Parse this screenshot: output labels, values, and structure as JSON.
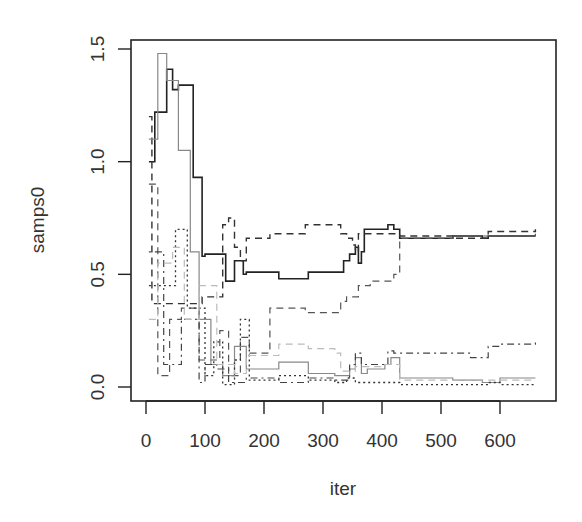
{
  "chart_data": {
    "type": "line",
    "subtype": "step",
    "title": "",
    "xlabel": "iter",
    "ylabel": "samps0",
    "xlim": [
      -25,
      700
    ],
    "ylim": [
      -0.06,
      1.55
    ],
    "x_ticks": [
      0,
      100,
      200,
      300,
      400,
      500,
      600
    ],
    "x_tick_labels": [
      "0",
      "100",
      "200",
      "300",
      "400",
      "500",
      "600"
    ],
    "y_ticks": [
      0.0,
      0.5,
      1.0,
      1.5
    ],
    "y_tick_labels": [
      "0.0",
      "0.5",
      "1.0",
      "1.5"
    ],
    "grid": false,
    "legend": null,
    "series": [
      {
        "name": "chain 1",
        "style": "solid",
        "color": "#222222",
        "width": 1.6,
        "x": [
          5,
          15,
          35,
          45,
          55,
          80,
          95,
          100,
          135,
          150,
          165,
          170,
          225,
          275,
          335,
          345,
          355,
          360,
          365,
          370,
          400,
          410,
          420,
          430,
          520,
          570,
          580,
          620,
          660
        ],
        "y": [
          1.0,
          1.22,
          1.41,
          1.32,
          1.34,
          0.93,
          0.58,
          0.59,
          0.47,
          0.56,
          0.5,
          0.51,
          0.48,
          0.51,
          0.56,
          0.59,
          0.62,
          0.55,
          0.6,
          0.7,
          0.7,
          0.72,
          0.7,
          0.66,
          0.67,
          0.66,
          0.67,
          0.67,
          0.67
        ]
      },
      {
        "name": "chain 2",
        "style": "dashed",
        "color": "#333333",
        "width": 1.4,
        "x": [
          5,
          10,
          95,
          130,
          140,
          150,
          160,
          170,
          210,
          270,
          330,
          340,
          350,
          355,
          360,
          430,
          520,
          580,
          660
        ],
        "y": [
          1.2,
          0.37,
          0.4,
          0.72,
          0.75,
          0.62,
          0.56,
          0.66,
          0.68,
          0.72,
          0.68,
          0.66,
          0.63,
          0.6,
          0.68,
          0.67,
          0.66,
          0.69,
          0.7
        ]
      },
      {
        "name": "chain 3",
        "style": "dashed",
        "color": "#555555",
        "width": 1.2,
        "x": [
          5,
          20,
          40,
          60,
          90,
          125,
          140,
          160,
          175,
          210,
          270,
          330,
          340,
          360,
          380,
          420,
          430,
          520,
          570,
          660
        ],
        "y": [
          0.9,
          0.05,
          0.3,
          0.35,
          0.12,
          0.25,
          0.05,
          0.22,
          0.15,
          0.35,
          0.33,
          0.38,
          0.4,
          0.45,
          0.47,
          0.5,
          0.66,
          0.67,
          0.67,
          0.68
        ]
      },
      {
        "name": "chain 4",
        "style": "solid",
        "color": "#888888",
        "width": 1.2,
        "x": [
          5,
          20,
          35,
          55,
          75,
          90,
          110,
          130,
          150,
          170,
          225,
          275,
          320,
          345,
          355,
          365,
          375,
          405,
          415,
          430,
          520,
          570,
          600,
          660
        ],
        "y": [
          1.1,
          1.48,
          1.36,
          1.05,
          0.6,
          0.3,
          0.1,
          0.05,
          0.18,
          0.08,
          0.11,
          0.06,
          0.05,
          0.08,
          0.13,
          0.06,
          0.08,
          0.1,
          0.13,
          0.04,
          0.03,
          0.02,
          0.04,
          0.04
        ]
      },
      {
        "name": "chain 5",
        "style": "dotdash",
        "color": "#444444",
        "width": 1.2,
        "x": [
          5,
          30,
          60,
          90,
          100,
          120,
          140,
          170,
          225,
          275,
          320,
          345,
          355,
          365,
          405,
          410,
          420,
          520,
          550,
          580,
          600,
          660
        ],
        "y": [
          0.6,
          0.1,
          0.3,
          0.02,
          0.1,
          0.08,
          0.02,
          0.04,
          0.02,
          0.04,
          0.03,
          0.1,
          0.15,
          0.1,
          0.1,
          0.16,
          0.15,
          0.15,
          0.13,
          0.18,
          0.19,
          0.21
        ]
      },
      {
        "name": "chain 6",
        "style": "dotted",
        "color": "#333333",
        "width": 1.3,
        "x": [
          5,
          50,
          70,
          100,
          115,
          130,
          150,
          160,
          175,
          225,
          275,
          320,
          340,
          355,
          405,
          430,
          520,
          580,
          600,
          660
        ],
        "y": [
          0.45,
          0.7,
          0.35,
          0.05,
          0.2,
          0.01,
          0.12,
          0.3,
          0.03,
          0.05,
          0.03,
          0.02,
          0.04,
          0.02,
          0.02,
          0.01,
          0.01,
          0.02,
          0.01,
          0.01
        ]
      },
      {
        "name": "chain 7",
        "style": "dashed",
        "color": "#bbbbbb",
        "width": 1.2,
        "x": [
          5,
          20,
          45,
          65,
          90,
          120,
          150,
          170,
          225,
          275,
          320,
          330,
          355,
          405,
          430,
          520,
          580,
          600,
          660
        ],
        "y": [
          0.3,
          0.55,
          0.62,
          0.3,
          0.45,
          0.1,
          0.06,
          0.14,
          0.19,
          0.17,
          0.15,
          0.07,
          0.09,
          0.1,
          0.03,
          0.03,
          0.03,
          0.03,
          0.03
        ]
      }
    ]
  }
}
